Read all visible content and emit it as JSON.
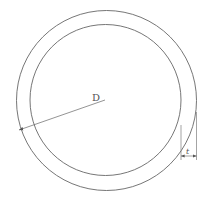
{
  "diagram": {
    "type": "pipe-cross-section",
    "labels": {
      "diameter": "D",
      "thickness": "t"
    },
    "colors": {
      "stroke": "#666666",
      "background": "#ffffff"
    }
  }
}
